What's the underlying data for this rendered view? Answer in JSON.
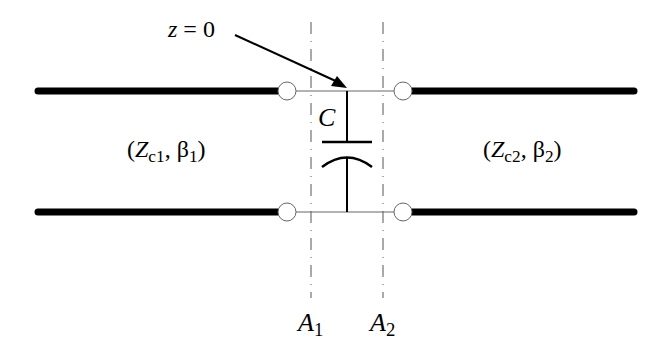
{
  "diagram": {
    "type": "circuit",
    "annotation": {
      "var": "z",
      "eq": " = 0"
    },
    "capacitor": {
      "label": "C"
    },
    "left_line": {
      "open": "(",
      "Z": "Z",
      "Zsub": "c1",
      "sep": ", ",
      "beta": "β",
      "betasub": "1",
      "close": ")"
    },
    "right_line": {
      "open": "(",
      "Z": "Z",
      "Zsub": "c2",
      "sep": ", ",
      "beta": "β",
      "betasub": "2",
      "close": ")"
    },
    "planes": [
      {
        "name": "A",
        "sub": "1"
      },
      {
        "name": "A",
        "sub": "2"
      }
    ],
    "colors": {
      "line": "#000000",
      "plane": "#555555",
      "thin": "#666666"
    }
  }
}
